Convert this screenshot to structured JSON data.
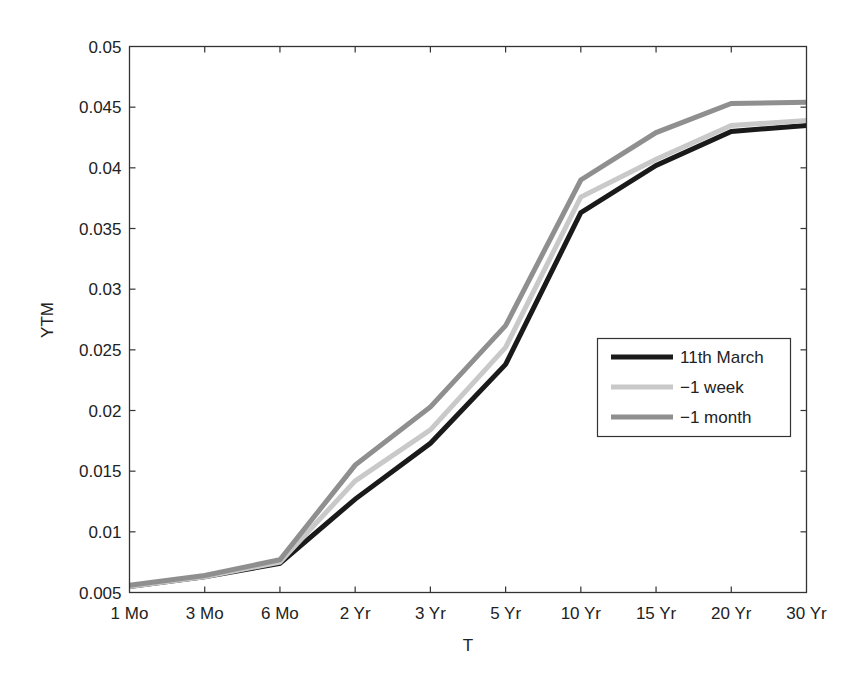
{
  "chart_data": {
    "type": "line",
    "title": "",
    "xlabel": "T",
    "ylabel": "YTM",
    "categories": [
      "1 Mo",
      "3 Mo",
      "6 Mo",
      "2 Yr",
      "3 Yr",
      "5 Yr",
      "10 Yr",
      "15 Yr",
      "20 Yr",
      "30 Yr"
    ],
    "ylim": [
      0.005,
      0.05
    ],
    "yticks": [
      0.005,
      0.01,
      0.015,
      0.02,
      0.025,
      0.03,
      0.035,
      0.04,
      0.045,
      0.05
    ],
    "ytick_labels": [
      "0.005",
      "0.01",
      "0.015",
      "0.02",
      "0.025",
      "0.03",
      "0.035",
      "0.04",
      "0.045",
      "0.05"
    ],
    "grid": false,
    "legend_position": "center-right",
    "series": [
      {
        "name": "11th March",
        "color": "#1a1a1a",
        "values": [
          0.0055,
          0.0063,
          0.0074,
          0.0127,
          0.0173,
          0.0238,
          0.0363,
          0.0402,
          0.043,
          0.0435
        ]
      },
      {
        "name": "−1 week",
        "color": "#c9c9c9",
        "values": [
          0.0055,
          0.0063,
          0.0075,
          0.0142,
          0.0184,
          0.0252,
          0.0376,
          0.0407,
          0.0435,
          0.0439
        ]
      },
      {
        "name": "−1 month",
        "color": "#8f8f8f",
        "values": [
          0.0056,
          0.0064,
          0.0077,
          0.0155,
          0.0203,
          0.027,
          0.039,
          0.0429,
          0.0453,
          0.0454
        ]
      }
    ]
  }
}
